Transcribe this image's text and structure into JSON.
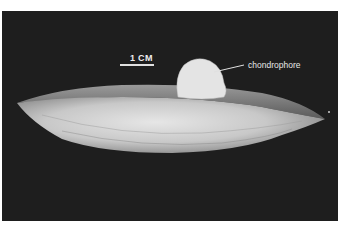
{
  "figure": {
    "scale_bar": {
      "label": "1 CM"
    },
    "annotations": [
      {
        "label": "chondrophore"
      }
    ],
    "colors": {
      "background": "#1e1e1e",
      "shell_light": "#dcdcdc",
      "shell_dark": "#7a7a7a",
      "text": "#eeeeee"
    }
  }
}
